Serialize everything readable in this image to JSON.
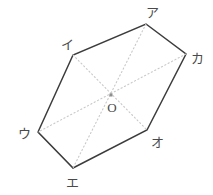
{
  "figure": {
    "type": "hexagon-with-diagonals",
    "background_color": "#ffffff",
    "outline_color": "#3c3c3c",
    "diagonal_color": "#c9c9c9",
    "label_color": "#4a4a4a",
    "center": {
      "label": "O",
      "x": 111,
      "y": 95,
      "label_x": 112,
      "label_y": 107
    },
    "vertices": [
      {
        "label": "ア",
        "x": 146,
        "y": 24,
        "label_x": 152,
        "label_y": 12
      },
      {
        "label": "カ",
        "x": 186,
        "y": 54,
        "label_x": 197,
        "label_y": 58
      },
      {
        "label": "オ",
        "x": 147,
        "y": 130,
        "label_x": 157,
        "label_y": 142
      },
      {
        "label": "エ",
        "x": 73,
        "y": 168,
        "label_x": 72,
        "label_y": 182
      },
      {
        "label": "ウ",
        "x": 38,
        "y": 132,
        "label_x": 24,
        "label_y": 133
      },
      {
        "label": "イ",
        "x": 73,
        "y": 55,
        "label_x": 67,
        "label_y": 44
      }
    ],
    "outline_points": "146,24 186,54 147,130 73,168 38,132 73,55",
    "diagonals": [
      {
        "name": "diagonal-a-e",
        "from": "ア",
        "to": "エ",
        "x1": 146,
        "y1": 24,
        "x2": 73,
        "y2": 168
      },
      {
        "name": "diagonal-ka-u",
        "from": "カ",
        "to": "ウ",
        "x1": 186,
        "y1": 54,
        "x2": 38,
        "y2": 132
      },
      {
        "name": "diagonal-i-o",
        "from": "イ",
        "to": "オ",
        "x1": 73,
        "y1": 55,
        "x2": 147,
        "y2": 130
      }
    ]
  }
}
